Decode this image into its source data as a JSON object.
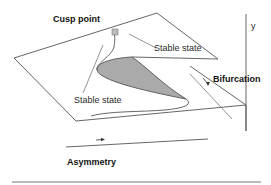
{
  "diagram": {
    "type": "cusp-catastrophe-surface",
    "labels": {
      "cusp_point": "Cusp point",
      "stable_state_upper": "Stable state",
      "stable_state_lower": "Stable state",
      "bifurcation": "Bifurcation",
      "asymmetry": "Asymmetry",
      "y_axis": "y"
    },
    "colors": {
      "line": "#555555",
      "fold_fill": "#aaaaaa",
      "marker": "#bbbbbb",
      "text": "#222222"
    }
  }
}
